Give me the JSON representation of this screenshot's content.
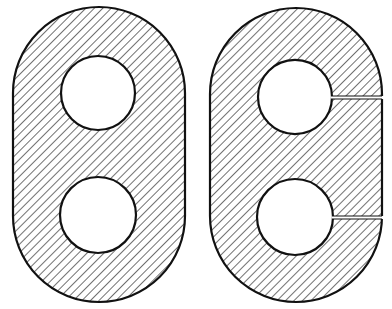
{
  "figure": {
    "colors": {
      "background": "#ffffff",
      "stroke": "#111111",
      "hatch": "#333333"
    },
    "hatch": {
      "angle_deg": 45,
      "spacing_px": 6
    },
    "plates": [
      {
        "id": "left-plate",
        "outer": {
          "x": 13,
          "y": 7,
          "width": 172,
          "height": 295
        },
        "holes": [
          {
            "cx": 98,
            "cy": 93,
            "r": 37
          },
          {
            "cx": 98,
            "cy": 215,
            "r": 38
          }
        ],
        "slits": []
      },
      {
        "id": "right-plate",
        "outer": {
          "x": 210,
          "y": 8,
          "width": 172,
          "height": 294
        },
        "holes": [
          {
            "cx": 295,
            "cy": 97,
            "r": 37
          },
          {
            "cx": 295,
            "cy": 217,
            "r": 38
          }
        ],
        "slits": [
          {
            "y": 97.5,
            "height": 3
          },
          {
            "y": 217.5,
            "height": 3
          }
        ]
      }
    ]
  }
}
